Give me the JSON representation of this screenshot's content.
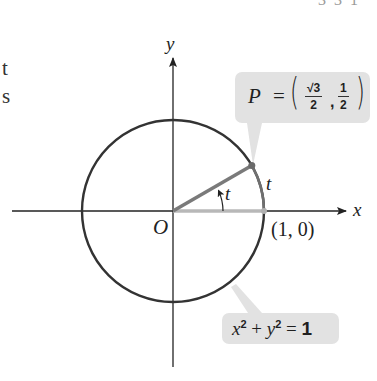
{
  "page": {
    "page_number_fragment": "3 3 1",
    "left_text_fragments": [
      "t",
      "s"
    ]
  },
  "diagram": {
    "axes": {
      "x_label": "x",
      "y_label": "y",
      "origin_label": "O"
    },
    "circle": {
      "equation_label_parts": {
        "x": "x",
        "exp1": "2",
        "plus": " + ",
        "y": "y",
        "exp2": "2",
        "equals": " = ",
        "rhs": "1"
      },
      "equation": "x^2 + y^2 = 1",
      "center": [
        0,
        0
      ],
      "radius": 1
    },
    "point_P": {
      "label": "P",
      "equals": "=",
      "x_numerator": "√3",
      "x_denominator": "2",
      "y_numerator": "1",
      "y_denominator": "2",
      "comma": ",",
      "value": "(√3/2, 1/2)",
      "angle_deg": 30
    },
    "point_start": {
      "label": "(1, 0)"
    },
    "angle_label": "t",
    "arc_label": "t",
    "colors": {
      "circle": "#333333",
      "radius_to_P": "#7a7a7a",
      "radius_to_start": "#b8b8b8",
      "arc_t": "#6f6f6f",
      "callout_bg": "#e2e2e2",
      "axes": "#222222"
    }
  }
}
